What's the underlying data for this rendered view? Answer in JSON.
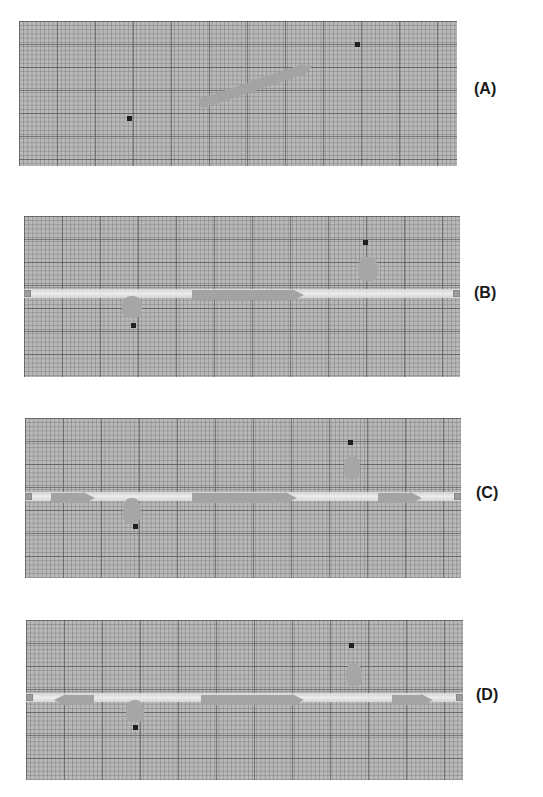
{
  "figure": {
    "panels": [
      {
        "label": "(A)",
        "box": {
          "x": 19,
          "y": 21,
          "w": 438,
          "h": 145
        },
        "corridor": null,
        "dots": [
          {
            "x": 108,
            "y": 95
          },
          {
            "x": 336,
            "y": 21
          }
        ],
        "blobs": [],
        "arrows": [
          {
            "x1": 181,
            "y1": 83,
            "x2": 294,
            "y2": 45,
            "dir": "right"
          }
        ]
      },
      {
        "label": "(B)",
        "box": {
          "x": 24,
          "y": 216,
          "w": 436,
          "h": 161
        },
        "corridor": {
          "y": 73
        },
        "dots": [
          {
            "x": 107,
            "y": 107
          },
          {
            "x": 339,
            "y": 24
          }
        ],
        "blobs": [
          {
            "x": 98,
            "y": 80,
            "w": 20,
            "h": 22
          },
          {
            "x": 334,
            "y": 41,
            "w": 20,
            "h": 24
          }
        ],
        "arrows": [
          {
            "x1": 168,
            "y1": 79,
            "x2": 280,
            "y2": 79,
            "dir": "right"
          }
        ]
      },
      {
        "label": "(C)",
        "box": {
          "x": 25,
          "y": 418,
          "w": 436,
          "h": 160
        },
        "corridor": {
          "y": 74
        },
        "dots": [
          {
            "x": 108,
            "y": 106
          },
          {
            "x": 323,
            "y": 22
          }
        ],
        "blobs": [
          {
            "x": 98,
            "y": 80,
            "w": 18,
            "h": 25
          },
          {
            "x": 319,
            "y": 38,
            "w": 16,
            "h": 23
          }
        ],
        "arrows": [
          {
            "x1": 26,
            "y1": 80,
            "x2": 70,
            "y2": 80,
            "dir": "right"
          },
          {
            "x1": 167,
            "y1": 80,
            "x2": 272,
            "y2": 80,
            "dir": "right"
          },
          {
            "x1": 353,
            "y1": 80,
            "x2": 397,
            "y2": 80,
            "dir": "right"
          }
        ]
      },
      {
        "label": "(D)",
        "box": {
          "x": 26,
          "y": 620,
          "w": 437,
          "h": 160
        },
        "corridor": {
          "y": 73
        },
        "dots": [
          {
            "x": 107,
            "y": 105
          },
          {
            "x": 323,
            "y": 23
          }
        ],
        "blobs": [
          {
            "x": 100,
            "y": 80,
            "w": 18,
            "h": 22
          },
          {
            "x": 320,
            "y": 43,
            "w": 16,
            "h": 23
          }
        ],
        "arrows": [
          {
            "x1": 28,
            "y1": 80,
            "x2": 68,
            "y2": 80,
            "dir": "left"
          },
          {
            "x1": 175,
            "y1": 80,
            "x2": 278,
            "y2": 80,
            "dir": "right"
          },
          {
            "x1": 366,
            "y1": 80,
            "x2": 407,
            "y2": 80,
            "dir": "right"
          }
        ]
      }
    ],
    "label_positions": [
      {
        "x": 474,
        "y": 80
      },
      {
        "x": 474,
        "y": 284
      },
      {
        "x": 476,
        "y": 484
      },
      {
        "x": 476,
        "y": 686
      }
    ],
    "colors": {
      "grid_bg": "#b9b9b9",
      "arrow": "#a3a3a3",
      "blob": "#a6a6a6",
      "dot": "#1f1f1f",
      "corridor": "#efefef",
      "label": "#1a1a1a"
    }
  }
}
